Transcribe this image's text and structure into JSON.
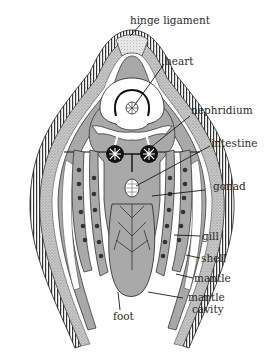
{
  "figure": {
    "colors": {
      "background": "#ffffff",
      "tissue_gray": "#a9a9a9",
      "tissue_light": "#c6c6c6",
      "stipple": "#b5b5b5",
      "outline": "#1a1a1a",
      "white_space": "#ffffff"
    }
  },
  "labels": {
    "hinge_ligament": "hinge ligament",
    "heart": "heart",
    "nephridium": "nephridium",
    "intestine": "intestine",
    "gonad": "gonad",
    "gill": "gill",
    "shell": "shell",
    "mantle": "mantle",
    "mantle_cavity_line1": "mantle",
    "mantle_cavity_line2": "cavity",
    "foot": "foot"
  }
}
